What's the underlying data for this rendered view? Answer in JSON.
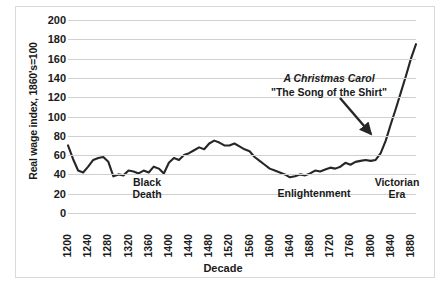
{
  "chart_data": {
    "type": "line",
    "title": "",
    "xlabel": "Decade",
    "ylabel": "Real wage index, 1860's=100",
    "ylim": [
      0,
      200
    ],
    "ytick_step": 20,
    "xlim": [
      1200,
      1890
    ],
    "xtick_step": 40,
    "grid": true,
    "legend": "none",
    "line_color": "#262626",
    "yticks": [
      "200",
      "180",
      "160",
      "140",
      "120",
      "100",
      "80",
      "60",
      "40",
      "20",
      "0"
    ],
    "xticks": [
      "1200",
      "1240",
      "1280",
      "1320",
      "1360",
      "1400",
      "1440",
      "1480",
      "1520",
      "1560",
      "1600",
      "1640",
      "1680",
      "1720",
      "1760",
      "1800",
      "1840",
      "1880"
    ],
    "series": [
      {
        "name": "Real wage index",
        "x": [
          1200,
          1210,
          1220,
          1230,
          1240,
          1250,
          1260,
          1270,
          1280,
          1290,
          1300,
          1310,
          1320,
          1330,
          1340,
          1350,
          1360,
          1370,
          1380,
          1390,
          1400,
          1410,
          1420,
          1430,
          1440,
          1450,
          1460,
          1470,
          1480,
          1490,
          1500,
          1510,
          1520,
          1530,
          1540,
          1550,
          1560,
          1570,
          1580,
          1590,
          1600,
          1610,
          1620,
          1630,
          1640,
          1650,
          1660,
          1670,
          1680,
          1690,
          1700,
          1710,
          1720,
          1730,
          1740,
          1750,
          1760,
          1770,
          1780,
          1790,
          1800,
          1810,
          1820,
          1830,
          1840,
          1850,
          1860,
          1870,
          1880,
          1890
        ],
        "values": [
          70,
          56,
          44,
          42,
          48,
          55,
          57,
          58,
          53,
          38,
          40,
          39,
          44,
          43,
          41,
          44,
          42,
          48,
          46,
          41,
          52,
          57,
          55,
          60,
          62,
          65,
          68,
          66,
          72,
          75,
          73,
          70,
          70,
          72,
          69,
          66,
          64,
          58,
          54,
          50,
          46,
          44,
          42,
          40,
          37,
          38,
          40,
          39,
          41,
          44,
          43,
          45,
          47,
          46,
          48,
          52,
          50,
          53,
          54,
          55,
          54,
          55,
          62,
          75,
          92,
          108,
          125,
          142,
          160,
          175
        ]
      }
    ],
    "annotations": [
      {
        "name": "black-death",
        "text_line1": "Black",
        "text_line2": "Death"
      },
      {
        "name": "enlightenment",
        "text_line1": "Enlightenment",
        "text_line2": ""
      },
      {
        "name": "victorian-era",
        "text_line1": "Victorian",
        "text_line2": "Era"
      },
      {
        "name": "callout",
        "text_line1": "A Christmas Carol",
        "text_line2": "\"The Song of the Shirt\""
      }
    ]
  }
}
